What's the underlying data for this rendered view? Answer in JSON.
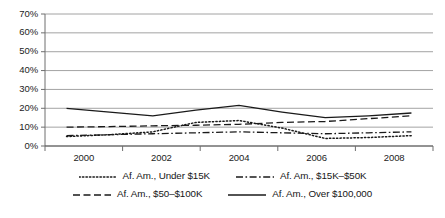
{
  "chart_data": {
    "type": "line",
    "title": "",
    "xlabel": "",
    "ylabel": "",
    "x": [
      2000,
      2001,
      2002,
      2003,
      2004,
      2005,
      2006,
      2007,
      2008
    ],
    "tick_labels_x": [
      "2000",
      "2002",
      "2004",
      "2006",
      "2008"
    ],
    "tick_values_x": [
      2000,
      2002,
      2004,
      2006,
      2008
    ],
    "tick_labels_y": [
      "0%",
      "10%",
      "20%",
      "30%",
      "40%",
      "50%",
      "60%",
      "70%"
    ],
    "tick_values_y": [
      0,
      10,
      20,
      30,
      40,
      50,
      60,
      70
    ],
    "ylim": [
      0,
      70
    ],
    "xlim": [
      1999.5,
      2008.5
    ],
    "grid": "horizontal",
    "legend_position": "bottom",
    "series": [
      {
        "name": "Af. Am., Under $15K",
        "style": "dotted",
        "color": "#1a1a1a",
        "values": [
          5.0,
          6.0,
          7.5,
          12.5,
          13.5,
          9.5,
          4.0,
          4.5,
          5.5
        ]
      },
      {
        "name": "Af. Am., $15K–$50K",
        "style": "dash-dot",
        "color": "#1a1a1a",
        "values": [
          5.5,
          6.0,
          6.5,
          7.0,
          7.5,
          7.0,
          6.5,
          7.0,
          7.5
        ]
      },
      {
        "name": "Af. Am., $50–$100K",
        "style": "dashed",
        "color": "#1a1a1a",
        "values": [
          10.0,
          10.3,
          10.7,
          11.0,
          11.5,
          12.5,
          13.0,
          14.5,
          16.0
        ]
      },
      {
        "name": "Af. Am., Over $100,000",
        "style": "solid",
        "color": "#1a1a1a",
        "values": [
          20.0,
          18.0,
          16.0,
          19.0,
          21.5,
          18.0,
          15.0,
          16.0,
          17.5
        ]
      }
    ]
  },
  "axis": {
    "y_labels": [
      "70%",
      "60%",
      "50%",
      "40%",
      "30%",
      "20%",
      "10%",
      "0%"
    ],
    "x_labels": [
      "2000",
      "2002",
      "2004",
      "2006",
      "2008"
    ]
  },
  "legend": {
    "items": [
      {
        "label": "Af. Am., Under $15K",
        "style": "dotted"
      },
      {
        "label": "Af. Am., $15K–$50K",
        "style": "dash-dot"
      },
      {
        "label": "Af. Am., $50–$100K",
        "style": "dashed"
      },
      {
        "label": "Af. Am., Over $100,000",
        "style": "solid"
      }
    ]
  }
}
